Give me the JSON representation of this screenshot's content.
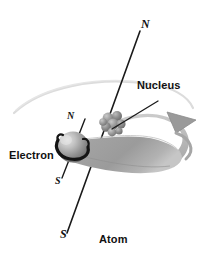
{
  "figure": {
    "title": "Atom",
    "background_color": "#ffffff",
    "width": 209,
    "height": 258
  },
  "labels": {
    "axis_north_top": "N",
    "axis_south_bottom": "S",
    "electron_north": "N",
    "electron_south": "S",
    "nucleus": "Nucleus",
    "electron": "Electron",
    "atom": "Atom"
  },
  "colors": {
    "line": "#1a1a1a",
    "text": "#111111",
    "orbit_ribbon": "#a8a8a8",
    "orbit_ribbon_light": "#d0d0d0",
    "orbit_ribbon_dark": "#8e8e8e",
    "orbit_faint_arc": "#d8d8d8",
    "electron_sphere_light": "#d8d8d8",
    "electron_sphere_mid": "#9a9a9a",
    "electron_sphere_dark": "#5c5c5c",
    "nucleus_sphere_light": "#b4b4b4",
    "nucleus_sphere_dark": "#6e6e6e",
    "spin_arrow": "#141414"
  },
  "diagram": {
    "type": "atom-magnetism-illustration",
    "elements": [
      "spin-axis-line",
      "orbit-ribbon",
      "orbit-arrowhead",
      "electron-sphere",
      "electron-spin-arrow",
      "electron-axis-line",
      "nucleus-cluster",
      "nucleus-leader-line",
      "faint-orbit-arc"
    ],
    "nucleus_position": [
      114,
      124
    ],
    "electron_position": [
      73,
      147
    ],
    "axis_top_point": [
      140,
      31
    ],
    "axis_bottom_point": [
      67,
      233
    ],
    "arrowhead_position": [
      186,
      122
    ]
  }
}
